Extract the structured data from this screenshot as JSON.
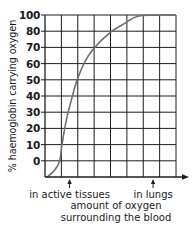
{
  "chart_data": {
    "type": "line",
    "title": "",
    "xlabel": "amount of oxygen surrounding the blood",
    "xlabel_lines": [
      "amount of oxygen",
      "surrounding the blood"
    ],
    "ylabel": "% haemoglobin carrying oxygen",
    "y_tick_labels": [
      "100",
      "80",
      "70",
      "60",
      "50",
      "40",
      "30",
      "20",
      "10",
      "0"
    ],
    "y_tick_rows": [
      10,
      9,
      8,
      7,
      6,
      5,
      4,
      3,
      2,
      1
    ],
    "x_annotations": [
      {
        "label": "in active tissues",
        "x_grid": 1.5
      },
      {
        "label": "in lungs",
        "x_grid": 6.6
      }
    ],
    "grid": true,
    "grid_columns": 8,
    "grid_rows": 10,
    "x_ticks_labeled": false,
    "series": [
      {
        "name": "oxygen dissociation curve",
        "color": "#6e6e6e",
        "points_grid": [
          [
            0.12,
            0
          ],
          [
            0.6,
            0.43
          ],
          [
            0.9,
            1
          ],
          [
            1.04,
            2
          ],
          [
            1.3,
            3.5
          ],
          [
            1.65,
            4.9
          ],
          [
            1.95,
            5.95
          ],
          [
            2.4,
            7.05
          ],
          [
            2.95,
            7.9
          ],
          [
            3.95,
            8.9
          ],
          [
            4.9,
            9.5
          ],
          [
            5.8,
            9.95
          ],
          [
            8,
            10
          ]
        ]
      }
    ]
  },
  "colors": {
    "grid": "#1e1e1e",
    "curve": "#6e6e6e",
    "text": "#1a1a1a"
  }
}
